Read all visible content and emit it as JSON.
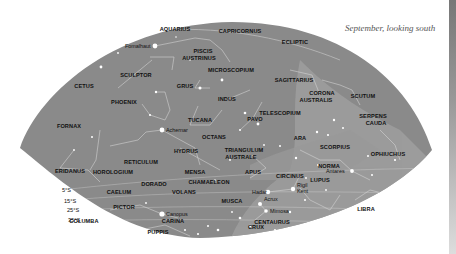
{
  "caption": "September, looking south",
  "colors": {
    "sky": "#8a8a8a",
    "milky_way": "#a3a3a3",
    "lines": "#d8d8d8",
    "background": "#ffffff"
  },
  "constellations": [
    {
      "name": "AQUARIUS",
      "x": 175,
      "y": 29
    },
    {
      "name": "CAPRICORNUS",
      "x": 240,
      "y": 31
    },
    {
      "name": "ECLIPTIC",
      "x": 295,
      "y": 42
    },
    {
      "name": "PISCIS",
      "x": 203,
      "y": 51
    },
    {
      "name": "AUSTRINUS",
      "x": 199,
      "y": 58
    },
    {
      "name": "CETUS",
      "x": 84,
      "y": 86
    },
    {
      "name": "SCULPTOR",
      "x": 136,
      "y": 75
    },
    {
      "name": "MICROSCOPIUM",
      "x": 231,
      "y": 70
    },
    {
      "name": "SAGITTARIUS",
      "x": 294,
      "y": 80
    },
    {
      "name": "GRUS",
      "x": 185,
      "y": 86
    },
    {
      "name": "PHOENIX",
      "x": 124,
      "y": 102
    },
    {
      "name": "INDUS",
      "x": 227,
      "y": 99
    },
    {
      "name": "CORONA",
      "x": 322,
      "y": 93
    },
    {
      "name": "AUSTRALIS",
      "x": 316,
      "y": 100
    },
    {
      "name": "SCUTUM",
      "x": 363,
      "y": 96
    },
    {
      "name": "TELESCOPIUM",
      "x": 280,
      "y": 113
    },
    {
      "name": "PAVO",
      "x": 255,
      "y": 119
    },
    {
      "name": "SERPENS",
      "x": 373,
      "y": 116
    },
    {
      "name": "CAUDA",
      "x": 376,
      "y": 123
    },
    {
      "name": "FORNAX",
      "x": 69,
      "y": 126
    },
    {
      "name": "TUCANA",
      "x": 200,
      "y": 120
    },
    {
      "name": "OCTANS",
      "x": 214,
      "y": 137
    },
    {
      "name": "ARA",
      "x": 300,
      "y": 138
    },
    {
      "name": "SCORPIUS",
      "x": 335,
      "y": 147
    },
    {
      "name": "OPHIUCHUS",
      "x": 388,
      "y": 154
    },
    {
      "name": "HYDRUS",
      "x": 186,
      "y": 151
    },
    {
      "name": "TRIANGULUM",
      "x": 244,
      "y": 150
    },
    {
      "name": "AUSTRALE",
      "x": 241,
      "y": 157
    },
    {
      "name": "RETICULUM",
      "x": 141,
      "y": 162
    },
    {
      "name": "NORMA",
      "x": 329,
      "y": 166
    },
    {
      "name": "ERIDANUS",
      "x": 70,
      "y": 171
    },
    {
      "name": "HOROLOGIUM",
      "x": 113,
      "y": 172
    },
    {
      "name": "MENSA",
      "x": 195,
      "y": 172
    },
    {
      "name": "APUS",
      "x": 253,
      "y": 172
    },
    {
      "name": "CIRCINUS",
      "x": 290,
      "y": 176
    },
    {
      "name": "LUPUS",
      "x": 320,
      "y": 180
    },
    {
      "name": "DORADO",
      "x": 154,
      "y": 184
    },
    {
      "name": "CHAMAELEON",
      "x": 209,
      "y": 182
    },
    {
      "name": "CAELUM",
      "x": 119,
      "y": 192
    },
    {
      "name": "VOLANS",
      "x": 184,
      "y": 192
    },
    {
      "name": "MUSCA",
      "x": 232,
      "y": 201
    },
    {
      "name": "LIBRA",
      "x": 366,
      "y": 209
    },
    {
      "name": "PICTOR",
      "x": 124,
      "y": 207
    },
    {
      "name": "COLUMBA",
      "x": 84,
      "y": 221
    },
    {
      "name": "CARINA",
      "x": 173,
      "y": 221
    },
    {
      "name": "CRUX",
      "x": 256,
      "y": 227
    },
    {
      "name": "CENTAURUS",
      "x": 272,
      "y": 222
    },
    {
      "name": "PUPPIS",
      "x": 158,
      "y": 232
    }
  ],
  "stars": [
    {
      "name": "Fomalhaut",
      "x": 155,
      "y": 46
    },
    {
      "name": "Achernar",
      "x": 162,
      "y": 130
    },
    {
      "name": "Canopus",
      "x": 162,
      "y": 214
    },
    {
      "name": "Hadar",
      "x": 268,
      "y": 192
    },
    {
      "name": "Rigil Kent",
      "x": 293,
      "y": 189
    },
    {
      "name": "Acrux",
      "x": 260,
      "y": 204
    },
    {
      "name": "Mimosa",
      "x": 266,
      "y": 211
    },
    {
      "name": "Antares",
      "x": 352,
      "y": 171
    }
  ],
  "declinations": [
    {
      "label": "5°S",
      "x": 62,
      "y": 190
    },
    {
      "label": "15°S",
      "x": 64,
      "y": 201
    },
    {
      "label": "25°S",
      "x": 67,
      "y": 210
    },
    {
      "label": "35°S",
      "x": 68,
      "y": 220
    }
  ]
}
